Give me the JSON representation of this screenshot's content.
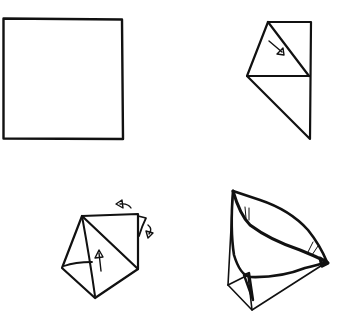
{
  "diagram": {
    "type": "origami-instructions",
    "background": "#ffffff",
    "ink_color": "#111111",
    "steps": [
      {
        "step": 1,
        "position": "top-left",
        "description": "Square sheet of paper",
        "arrows": []
      },
      {
        "step": 2,
        "position": "top-right",
        "description": "Paper folded diagonally with a flap folded down; arrow indicating fold direction",
        "arrows": [
          "fold-arrow-down-right"
        ]
      },
      {
        "step": 3,
        "position": "bottom-left",
        "description": "Triangular form with flap folded up; arrows indicating folding back the top corners",
        "arrows": [
          "fold-arrow-up",
          "rotate-arrow-left",
          "rotate-arrow-down"
        ]
      },
      {
        "step": 4,
        "position": "bottom-right",
        "description": "Finished opened cup shape",
        "arrows": []
      }
    ]
  }
}
